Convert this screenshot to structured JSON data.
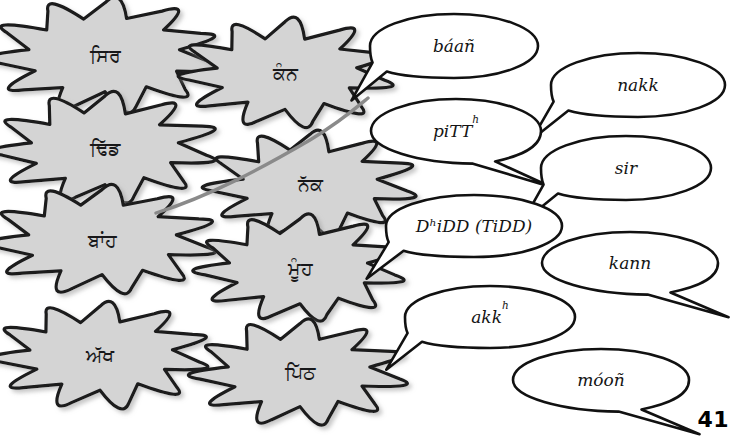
{
  "page": {
    "number": "41",
    "background_color": "#ffffff",
    "burst_fill_color": "#d4d4d4",
    "burst_stroke_color": "#1a1a1c",
    "bubble_fill_color": "#ffffff",
    "bubble_stroke_color": "#111111",
    "connector_color": "#8a8a8a"
  },
  "bursts": [
    {
      "id": "burst-sir",
      "label": "ਸਿਰ",
      "cx": 105,
      "cy": 55,
      "rx": 105,
      "ry": 52
    },
    {
      "id": "burst-kann",
      "label": "ਕੰਨ",
      "cx": 285,
      "cy": 73,
      "rx": 97,
      "ry": 49
    },
    {
      "id": "burst-dhidd",
      "label": "ਢਿੱਡ",
      "cx": 105,
      "cy": 148,
      "rx": 102,
      "ry": 50
    },
    {
      "id": "burst-nakk",
      "label": "ਨੱਕ",
      "cx": 310,
      "cy": 184,
      "rx": 96,
      "ry": 48
    },
    {
      "id": "burst-baan",
      "label": "ਬਾਂਹ",
      "cx": 102,
      "cy": 240,
      "rx": 102,
      "ry": 49
    },
    {
      "id": "burst-moon",
      "label": "ਮੂੰਹ",
      "cx": 300,
      "cy": 268,
      "rx": 95,
      "ry": 48
    },
    {
      "id": "burst-akkh",
      "label": "ਅੱਖ",
      "cx": 100,
      "cy": 355,
      "rx": 98,
      "ry": 48
    },
    {
      "id": "burst-pitth",
      "label": "ਪਿੱਠ",
      "cx": 300,
      "cy": 372,
      "rx": 97,
      "ry": 48
    }
  ],
  "bubbles": [
    {
      "id": "bubble-baan",
      "text": "báañ",
      "sup": "",
      "cx": 454,
      "cy": 46,
      "rx": 84,
      "ry": 32,
      "tail": "left"
    },
    {
      "id": "bubble-nakk",
      "text": "nakk",
      "sup": "",
      "cx": 638,
      "cy": 85,
      "rx": 87,
      "ry": 32,
      "tail": "left"
    },
    {
      "id": "bubble-pitth",
      "text": "piTT",
      "sup": "h",
      "cx": 456,
      "cy": 131,
      "rx": 85,
      "ry": 32,
      "tail": "right"
    },
    {
      "id": "bubble-sir",
      "text": "sir",
      "sup": "",
      "cx": 626,
      "cy": 168,
      "rx": 85,
      "ry": 32,
      "tail": "left"
    },
    {
      "id": "bubble-dhidd",
      "text": "DʰiDD (TiDD)",
      "sup": "",
      "cx": 474,
      "cy": 226,
      "rx": 88,
      "ry": 31,
      "tail": "left"
    },
    {
      "id": "bubble-kann",
      "text": "kann",
      "sup": "",
      "cx": 630,
      "cy": 263,
      "rx": 88,
      "ry": 31,
      "tail": "right"
    },
    {
      "id": "bubble-akkh",
      "text": "akk",
      "sup": "h",
      "cx": 490,
      "cy": 317,
      "rx": 85,
      "ry": 31,
      "tail": "left"
    },
    {
      "id": "bubble-moon",
      "text": "móoñ",
      "sup": "",
      "cx": 601,
      "cy": 380,
      "rx": 88,
      "ry": 31,
      "tail": "right"
    }
  ],
  "connector": {
    "id": "connector-line",
    "description": "hand-drawn grey curve",
    "path": "M 156 213 C 210 196, 262 168, 310 140 C 340 122, 356 108, 368 98"
  }
}
